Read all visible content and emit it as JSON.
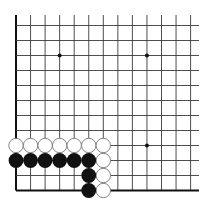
{
  "board": {
    "description": "Go board lower-left corner fragment",
    "columns": 13,
    "rows": 12,
    "origin_x": 16,
    "spacing_x": 14.55,
    "bottom_y": 190.5,
    "spacing_y": 15.0,
    "line_top": 15,
    "line_right": 199,
    "star_points": [
      [
        3,
        9
      ],
      [
        9,
        9
      ],
      [
        9,
        3
      ]
    ],
    "colors": {
      "line": "#3a3a3a",
      "border": "#111111",
      "black_stone": "#111111",
      "white_stone": "#ffffff",
      "white_stroke": "#777777"
    }
  },
  "stones": {
    "white": [
      [
        0,
        3
      ],
      [
        1,
        3
      ],
      [
        2,
        3
      ],
      [
        3,
        3
      ],
      [
        4,
        3
      ],
      [
        5,
        3
      ],
      [
        6,
        3
      ],
      [
        6,
        2
      ],
      [
        6,
        1
      ],
      [
        6,
        0
      ]
    ],
    "black": [
      [
        0,
        2
      ],
      [
        1,
        2
      ],
      [
        2,
        2
      ],
      [
        3,
        2
      ],
      [
        4,
        2
      ],
      [
        5,
        2
      ],
      [
        5,
        1
      ],
      [
        5,
        0
      ]
    ]
  }
}
